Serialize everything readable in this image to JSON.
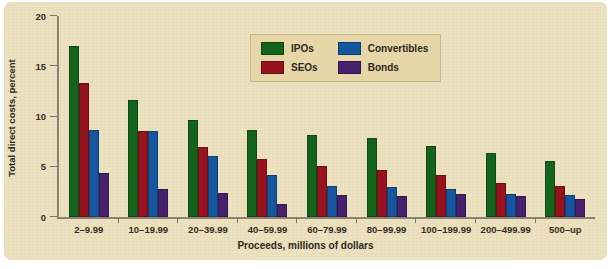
{
  "chart_data": {
    "type": "bar",
    "title": "",
    "xlabel": "Proceeds, millions of dollars",
    "ylabel": "Total direct costs, percent",
    "ylim": [
      0,
      20
    ],
    "yticks": [
      0,
      5,
      10,
      15,
      20
    ],
    "grid": false,
    "legend_position": "upper-center",
    "categories": [
      "2–9.99",
      "10–19.99",
      "20–39.99",
      "40–59.99",
      "60–79.99",
      "80–99.99",
      "100–199.99",
      "200–499.99",
      "500–up"
    ],
    "series": [
      {
        "name": "IPOs",
        "color": "#14631b",
        "values": [
          17.0,
          11.6,
          9.7,
          8.7,
          8.2,
          7.9,
          7.1,
          6.4,
          5.6
        ]
      },
      {
        "name": "SEOs",
        "color": "#97121f",
        "values": [
          13.3,
          8.6,
          7.0,
          5.8,
          5.1,
          4.7,
          4.2,
          3.4,
          3.1
        ]
      },
      {
        "name": "Convertibles",
        "color": "#15579f",
        "values": [
          8.7,
          8.6,
          6.1,
          4.2,
          3.1,
          3.0,
          2.8,
          2.3,
          2.2
        ]
      },
      {
        "name": "Bonds",
        "color": "#47206e",
        "values": [
          4.4,
          2.8,
          2.4,
          1.3,
          2.2,
          2.1,
          2.3,
          2.1,
          1.8
        ]
      }
    ]
  },
  "panel": {
    "background_color": "#ede2c0",
    "legend_background_color": "#e7d7a8"
  }
}
